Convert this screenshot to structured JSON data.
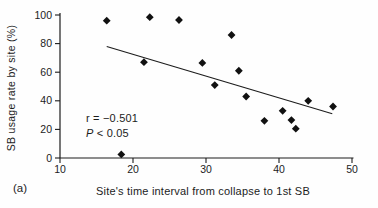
{
  "figure": {
    "panel_label": "(a)",
    "background": "#fefefe",
    "ink_color": "#1c1c1c"
  },
  "chart_data": {
    "type": "scatter",
    "title": "",
    "xlabel": "Site's time interval from collapse to 1st SB",
    "ylabel": "SB usage rate by site (%)",
    "xlim": [
      10,
      50
    ],
    "ylim": [
      0,
      100
    ],
    "x_ticks": [
      "10",
      "20",
      "30",
      "40",
      "50"
    ],
    "y_ticks": [
      "0",
      "20",
      "40",
      "60",
      "80",
      "100"
    ],
    "grid": false,
    "legend": "none",
    "marker": "diamond",
    "marker_color": "#111111",
    "points": [
      [
        16.4,
        96
      ],
      [
        22.3,
        98.5
      ],
      [
        26.3,
        96.5
      ],
      [
        33.5,
        86
      ],
      [
        21.5,
        67
      ],
      [
        29.5,
        66.5
      ],
      [
        34.5,
        61
      ],
      [
        31.2,
        51
      ],
      [
        35.5,
        43
      ],
      [
        38.0,
        26
      ],
      [
        40.5,
        33
      ],
      [
        41.7,
        26.5
      ],
      [
        42.3,
        20.5
      ],
      [
        44.0,
        40
      ],
      [
        47.4,
        36
      ],
      [
        18.4,
        2.5
      ]
    ],
    "trendline": {
      "x1": 16.4,
      "y1": 78,
      "x2": 47.3,
      "y2": 31
    },
    "annotation": {
      "r_label": "r = −0.501",
      "p_symbol": "P",
      "p_rest": " < 0.05"
    }
  }
}
